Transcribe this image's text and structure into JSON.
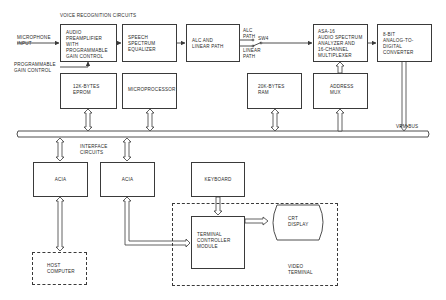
{
  "labels": {
    "voice_recognition_circuits": "VOICE RECOGNITION CIRCUITS",
    "microphone_input": "MICROPHONE\nINPUT",
    "programmable_gain_control": "PROGRAMMABLE\nGAIN CONTROL",
    "alc_path": "ALC\nPATH",
    "linear_path": "LINEAR\nPATH",
    "switch": "SW4",
    "vrm_bus": "VRM BUS",
    "interface_circuits": "INTERFACE\nCIRCUITS",
    "video_terminal": "VIDEO\nTERMINAL"
  },
  "blocks": {
    "audio_preamp": "AUDIO\nPREAMPLIFIER\nWITH\nPROGRAMMABLE\nGAIN CONTROL",
    "speech_equalizer": "SPEECH\nSPECTRUM\nEQUALIZER",
    "alc_linear": "ALC AND\nLINEAR PATH",
    "asa16": "ASA-16\nAUDIO SPECTRUM\nANALYZER AND\n16-CHANNEL\nMULTIPLEXER",
    "adc": "8-BIT\nANALOG-TO-\nDIGITAL\nCONVERTER",
    "eprom": "12K-BYTES\nEPROM",
    "microprocessor": "MICROPROCESSOR",
    "ram": "20K-BYTES\nRAM",
    "address_mux": "ADDRESS\nMUX",
    "acia_1": "ACIA",
    "acia_2": "ACIA",
    "keyboard": "KEYBOARD",
    "terminal_controller": "TERMINAL\nCONTROLLER\nMODULE",
    "crt_display": "CRT\nDISPLAY",
    "host_computer": "HOST\nCOMPUTER"
  },
  "colors": {
    "line": "#3a3a3a",
    "text": "#2a2a2a",
    "background": "#ffffff"
  }
}
